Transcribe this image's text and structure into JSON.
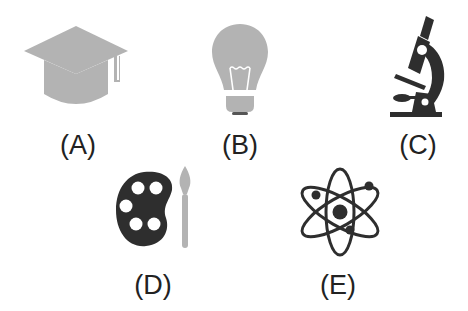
{
  "colors": {
    "light_gray": "#b3b3b3",
    "dark": "#2e2e2e",
    "white": "#ffffff",
    "label": "#222222"
  },
  "items": [
    {
      "id": "A",
      "label": "(A)",
      "icon": "graduation-cap-icon",
      "tone": "light-gray"
    },
    {
      "id": "B",
      "label": "(B)",
      "icon": "light-bulb-icon",
      "tone": "light-gray"
    },
    {
      "id": "C",
      "label": "(C)",
      "icon": "microscope-icon",
      "tone": "dark"
    },
    {
      "id": "D",
      "label": "(D)",
      "icon": "paint-palette-brush-icon",
      "tone": "dark-with-gray-brush"
    },
    {
      "id": "E",
      "label": "(E)",
      "icon": "atom-icon",
      "tone": "dark"
    }
  ]
}
